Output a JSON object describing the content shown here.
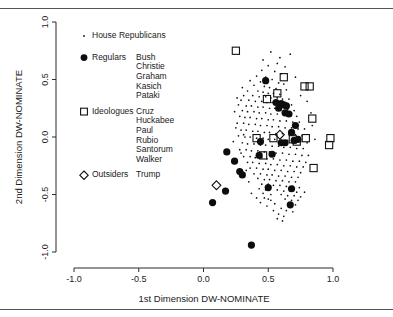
{
  "chart_data": {
    "type": "scatter",
    "title": "",
    "xlabel": "1st Dimension DW-NOMINATE",
    "ylabel": "2nd Dimension DW-NOMINATE",
    "xlim": [
      -1.0,
      1.0
    ],
    "ylim": [
      -1.0,
      1.0
    ],
    "xticks": [
      "-1.0",
      "-0.5",
      "0.0",
      "0.5",
      "1.0"
    ],
    "xtick_values": [
      -1.0,
      -0.5,
      0.0,
      0.5,
      1.0
    ],
    "yticks": [
      "-1.0",
      "-0.5",
      "0.0",
      "0.5",
      "1.0"
    ],
    "ytick_values": [
      -1.0,
      -0.5,
      0.0,
      0.5,
      1.0
    ],
    "grid": false,
    "legend_position": "upper-left-inside",
    "series": [
      {
        "name": "House Republicans",
        "marker": "dot",
        "points": [
          [
            0.52,
            0.74
          ],
          [
            0.67,
            0.72
          ],
          [
            0.57,
            0.64
          ],
          [
            0.5,
            0.62
          ],
          [
            0.45,
            0.58
          ],
          [
            0.55,
            0.57
          ],
          [
            0.6,
            0.55
          ],
          [
            0.41,
            0.53
          ],
          [
            0.48,
            0.52
          ],
          [
            0.53,
            0.5
          ],
          [
            0.36,
            0.49
          ],
          [
            0.44,
            0.48
          ],
          [
            0.58,
            0.47
          ],
          [
            0.62,
            0.46
          ],
          [
            0.39,
            0.45
          ],
          [
            0.47,
            0.44
          ],
          [
            0.51,
            0.43
          ],
          [
            0.56,
            0.42
          ],
          [
            0.64,
            0.41
          ],
          [
            0.34,
            0.4
          ],
          [
            0.42,
            0.4
          ],
          [
            0.46,
            0.39
          ],
          [
            0.5,
            0.38
          ],
          [
            0.54,
            0.38
          ],
          [
            0.59,
            0.37
          ],
          [
            0.31,
            0.36
          ],
          [
            0.38,
            0.36
          ],
          [
            0.43,
            0.35
          ],
          [
            0.48,
            0.35
          ],
          [
            0.52,
            0.34
          ],
          [
            0.57,
            0.34
          ],
          [
            0.61,
            0.33
          ],
          [
            0.66,
            0.33
          ],
          [
            0.29,
            0.32
          ],
          [
            0.35,
            0.32
          ],
          [
            0.4,
            0.31
          ],
          [
            0.45,
            0.31
          ],
          [
            0.49,
            0.3
          ],
          [
            0.53,
            0.3
          ],
          [
            0.58,
            0.29
          ],
          [
            0.63,
            0.29
          ],
          [
            0.68,
            0.28
          ],
          [
            0.27,
            0.28
          ],
          [
            0.33,
            0.27
          ],
          [
            0.37,
            0.27
          ],
          [
            0.42,
            0.26
          ],
          [
            0.46,
            0.26
          ],
          [
            0.51,
            0.25
          ],
          [
            0.55,
            0.25
          ],
          [
            0.6,
            0.24
          ],
          [
            0.65,
            0.24
          ],
          [
            0.7,
            0.23
          ],
          [
            0.3,
            0.23
          ],
          [
            0.34,
            0.22
          ],
          [
            0.39,
            0.22
          ],
          [
            0.43,
            0.21
          ],
          [
            0.48,
            0.21
          ],
          [
            0.52,
            0.2
          ],
          [
            0.57,
            0.2
          ],
          [
            0.62,
            0.19
          ],
          [
            0.67,
            0.19
          ],
          [
            0.72,
            0.18
          ],
          [
            0.28,
            0.18
          ],
          [
            0.32,
            0.17
          ],
          [
            0.36,
            0.17
          ],
          [
            0.41,
            0.16
          ],
          [
            0.45,
            0.16
          ],
          [
            0.5,
            0.15
          ],
          [
            0.54,
            0.15
          ],
          [
            0.59,
            0.14
          ],
          [
            0.64,
            0.14
          ],
          [
            0.69,
            0.13
          ],
          [
            0.74,
            0.13
          ],
          [
            0.26,
            0.12
          ],
          [
            0.31,
            0.12
          ],
          [
            0.35,
            0.11
          ],
          [
            0.4,
            0.11
          ],
          [
            0.44,
            0.1
          ],
          [
            0.49,
            0.1
          ],
          [
            0.53,
            0.09
          ],
          [
            0.58,
            0.09
          ],
          [
            0.63,
            0.08
          ],
          [
            0.68,
            0.08
          ],
          [
            0.73,
            0.07
          ],
          [
            0.78,
            0.07
          ],
          [
            0.29,
            0.06
          ],
          [
            0.33,
            0.06
          ],
          [
            0.38,
            0.05
          ],
          [
            0.42,
            0.05
          ],
          [
            0.47,
            0.04
          ],
          [
            0.51,
            0.04
          ],
          [
            0.56,
            0.03
          ],
          [
            0.61,
            0.03
          ],
          [
            0.66,
            0.02
          ],
          [
            0.71,
            0.02
          ],
          [
            0.76,
            0.01
          ],
          [
            0.27,
            0.01
          ],
          [
            0.32,
            0.0
          ],
          [
            0.36,
            0.0
          ],
          [
            0.41,
            -0.01
          ],
          [
            0.46,
            -0.01
          ],
          [
            0.5,
            -0.02
          ],
          [
            0.55,
            -0.02
          ],
          [
            0.6,
            -0.03
          ],
          [
            0.65,
            -0.03
          ],
          [
            0.7,
            -0.04
          ],
          [
            0.75,
            -0.04
          ],
          [
            0.8,
            -0.05
          ],
          [
            0.3,
            -0.05
          ],
          [
            0.34,
            -0.06
          ],
          [
            0.39,
            -0.06
          ],
          [
            0.44,
            -0.07
          ],
          [
            0.48,
            -0.07
          ],
          [
            0.53,
            -0.08
          ],
          [
            0.58,
            -0.08
          ],
          [
            0.62,
            -0.09
          ],
          [
            0.67,
            -0.09
          ],
          [
            0.72,
            -0.1
          ],
          [
            0.77,
            -0.1
          ],
          [
            0.28,
            -0.11
          ],
          [
            0.33,
            -0.11
          ],
          [
            0.37,
            -0.12
          ],
          [
            0.42,
            -0.12
          ],
          [
            0.47,
            -0.13
          ],
          [
            0.51,
            -0.13
          ],
          [
            0.56,
            -0.14
          ],
          [
            0.61,
            -0.14
          ],
          [
            0.66,
            -0.15
          ],
          [
            0.71,
            -0.15
          ],
          [
            0.76,
            -0.16
          ],
          [
            0.81,
            -0.16
          ],
          [
            0.31,
            -0.17
          ],
          [
            0.36,
            -0.17
          ],
          [
            0.4,
            -0.18
          ],
          [
            0.45,
            -0.18
          ],
          [
            0.49,
            -0.19
          ],
          [
            0.54,
            -0.19
          ],
          [
            0.59,
            -0.2
          ],
          [
            0.64,
            -0.2
          ],
          [
            0.69,
            -0.21
          ],
          [
            0.74,
            -0.21
          ],
          [
            0.34,
            -0.22
          ],
          [
            0.38,
            -0.22
          ],
          [
            0.43,
            -0.23
          ],
          [
            0.48,
            -0.23
          ],
          [
            0.52,
            -0.24
          ],
          [
            0.57,
            -0.24
          ],
          [
            0.62,
            -0.25
          ],
          [
            0.67,
            -0.25
          ],
          [
            0.72,
            -0.26
          ],
          [
            0.77,
            -0.26
          ],
          [
            0.36,
            -0.27
          ],
          [
            0.41,
            -0.27
          ],
          [
            0.46,
            -0.28
          ],
          [
            0.5,
            -0.28
          ],
          [
            0.55,
            -0.29
          ],
          [
            0.6,
            -0.29
          ],
          [
            0.65,
            -0.3
          ],
          [
            0.7,
            -0.3
          ],
          [
            0.75,
            -0.31
          ],
          [
            0.39,
            -0.32
          ],
          [
            0.44,
            -0.32
          ],
          [
            0.49,
            -0.33
          ],
          [
            0.53,
            -0.33
          ],
          [
            0.58,
            -0.34
          ],
          [
            0.63,
            -0.34
          ],
          [
            0.68,
            -0.35
          ],
          [
            0.73,
            -0.35
          ],
          [
            0.42,
            -0.36
          ],
          [
            0.47,
            -0.37
          ],
          [
            0.51,
            -0.37
          ],
          [
            0.56,
            -0.38
          ],
          [
            0.61,
            -0.38
          ],
          [
            0.66,
            -0.39
          ],
          [
            0.71,
            -0.39
          ],
          [
            0.45,
            -0.41
          ],
          [
            0.5,
            -0.41
          ],
          [
            0.54,
            -0.42
          ],
          [
            0.59,
            -0.42
          ],
          [
            0.64,
            -0.43
          ],
          [
            0.69,
            -0.43
          ],
          [
            0.74,
            -0.44
          ],
          [
            0.43,
            -0.45
          ],
          [
            0.48,
            -0.46
          ],
          [
            0.57,
            -0.46
          ],
          [
            0.62,
            -0.47
          ],
          [
            0.67,
            -0.47
          ],
          [
            0.72,
            -0.48
          ],
          [
            0.78,
            -0.48
          ],
          [
            0.46,
            -0.49
          ],
          [
            0.52,
            -0.5
          ],
          [
            0.6,
            -0.5
          ],
          [
            0.65,
            -0.51
          ],
          [
            0.7,
            -0.51
          ],
          [
            0.75,
            -0.52
          ],
          [
            0.41,
            -0.53
          ],
          [
            0.5,
            -0.54
          ],
          [
            0.63,
            -0.54
          ],
          [
            0.68,
            -0.55
          ],
          [
            0.73,
            -0.55
          ],
          [
            0.44,
            -0.57
          ],
          [
            0.55,
            -0.58
          ],
          [
            0.66,
            -0.58
          ],
          [
            0.71,
            -0.59
          ],
          [
            0.6,
            -0.62
          ],
          [
            0.64,
            -0.64
          ],
          [
            0.69,
            -0.65
          ],
          [
            0.58,
            -0.67
          ],
          [
            0.62,
            -0.69
          ],
          [
            0.49,
            -0.6
          ],
          [
            0.84,
            0.1
          ],
          [
            0.86,
            -0.02
          ],
          [
            0.83,
            0.21
          ],
          [
            0.8,
            0.31
          ],
          [
            0.79,
            -0.22
          ],
          [
            0.3,
            0.43
          ],
          [
            0.26,
            0.34
          ],
          [
            0.24,
            0.22
          ],
          [
            0.25,
            0.08
          ],
          [
            0.23,
            -0.04
          ],
          [
            0.63,
            0.61
          ],
          [
            0.59,
            0.69
          ],
          [
            0.46,
            0.67
          ],
          [
            0.71,
            0.52
          ],
          [
            0.75,
            0.36
          ],
          [
            0.37,
            -0.49
          ],
          [
            0.35,
            -0.39
          ],
          [
            0.33,
            -0.29
          ],
          [
            0.29,
            -0.14
          ],
          [
            0.31,
            0.02
          ],
          [
            0.54,
            -0.64
          ],
          [
            0.57,
            -0.71
          ],
          [
            0.61,
            -0.73
          ],
          [
            0.52,
            -0.55
          ],
          [
            0.47,
            -0.53
          ]
        ]
      },
      {
        "name": "Regulars",
        "marker": "filled-circle",
        "members": [
          "Bush",
          "Christie",
          "Graham",
          "Kasich",
          "Pataki"
        ],
        "points": [
          [
            0.48,
            0.49
          ],
          [
            0.56,
            0.3
          ],
          [
            0.6,
            0.29
          ],
          [
            0.62,
            0.28
          ],
          [
            0.58,
            0.25
          ],
          [
            0.63,
            0.21
          ],
          [
            0.66,
            0.2
          ],
          [
            0.71,
            0.1
          ],
          [
            0.68,
            0.04
          ],
          [
            0.73,
            -0.02
          ],
          [
            0.44,
            -0.04
          ],
          [
            0.6,
            -0.05
          ],
          [
            0.63,
            -0.05
          ],
          [
            0.18,
            -0.13
          ],
          [
            0.43,
            -0.16
          ],
          [
            0.53,
            -0.15
          ],
          [
            0.24,
            -0.21
          ],
          [
            0.28,
            -0.3
          ],
          [
            0.17,
            -0.47
          ],
          [
            0.5,
            -0.44
          ],
          [
            0.68,
            -0.45
          ],
          [
            0.07,
            -0.57
          ],
          [
            0.67,
            -0.59
          ],
          [
            0.37,
            -0.94
          ],
          [
            0.64,
            0.27
          ],
          [
            0.3,
            -0.33
          ],
          [
            0.7,
            -0.03
          ]
        ]
      },
      {
        "name": "Ideologues",
        "marker": "open-square",
        "members": [
          "Cruz",
          "Huckabee",
          "Paul",
          "Rubio",
          "Santorum",
          "Walker"
        ],
        "points": [
          [
            0.25,
            0.75
          ],
          [
            0.62,
            0.52
          ],
          [
            0.78,
            0.44
          ],
          [
            0.82,
            0.44
          ],
          [
            0.57,
            0.38
          ],
          [
            0.49,
            0.33
          ],
          [
            0.84,
            0.16
          ],
          [
            0.41,
            -0.01
          ],
          [
            0.54,
            -0.01
          ],
          [
            0.69,
            -0.02
          ],
          [
            0.79,
            -0.01
          ],
          [
            0.98,
            -0.01
          ],
          [
            0.97,
            -0.07
          ],
          [
            0.72,
            -0.04
          ],
          [
            0.46,
            -0.16
          ],
          [
            0.85,
            -0.27
          ]
        ]
      },
      {
        "name": "Outsiders",
        "marker": "open-diamond",
        "members": [
          "Trump"
        ],
        "points": [
          [
            0.1,
            -0.42
          ],
          [
            0.59,
            0.02
          ]
        ]
      }
    ]
  },
  "legend": {
    "entries": [
      {
        "marker": "dot",
        "label": "House Republicans",
        "names": []
      },
      {
        "marker": "filled-circle",
        "label": "Regulars",
        "names": [
          "Bush",
          "Christie",
          "Graham",
          "Kasich",
          "Pataki"
        ]
      },
      {
        "marker": "open-square",
        "label": "Ideologues",
        "names": [
          "Cruz",
          "Huckabee",
          "Paul",
          "Rubio",
          "Santorum",
          "Walker"
        ]
      },
      {
        "marker": "open-diamond",
        "label": "Outsiders",
        "names": [
          "Trump"
        ]
      }
    ]
  },
  "colors": {
    "ink": "#111111",
    "rule": "#555555",
    "background": "#ffffff"
  }
}
